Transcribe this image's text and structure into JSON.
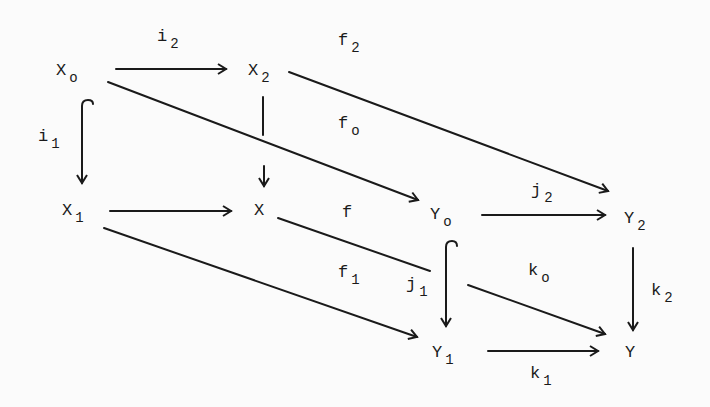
{
  "diagram": {
    "type": "commutative-cube",
    "nodes": [
      {
        "id": "X0",
        "base": "X",
        "sub": "o",
        "x": 56,
        "y": 62
      },
      {
        "id": "X2",
        "base": "X",
        "sub": "2",
        "x": 256,
        "y": 62
      },
      {
        "id": "X1",
        "base": "X",
        "sub": "1",
        "x": 64,
        "y": 202
      },
      {
        "id": "X",
        "base": "X",
        "sub": "",
        "x": 254,
        "y": 202
      },
      {
        "id": "Y0",
        "base": "Y",
        "sub": "o",
        "x": 434,
        "y": 205
      },
      {
        "id": "Y2",
        "base": "Y",
        "sub": "2",
        "x": 626,
        "y": 208
      },
      {
        "id": "Y1",
        "base": "Y",
        "sub": "1",
        "x": 434,
        "y": 342
      },
      {
        "id": "Y",
        "base": "Y",
        "sub": "",
        "x": 626,
        "y": 342
      }
    ],
    "labels": [
      {
        "id": "i2",
        "base": "i",
        "sub": "2",
        "x": 152,
        "y": 34
      },
      {
        "id": "f2",
        "base": "f",
        "sub": "2",
        "x": 338,
        "y": 34
      },
      {
        "id": "i1",
        "base": "i",
        "sub": "1",
        "x": 38,
        "y": 128
      },
      {
        "id": "f0",
        "base": "f",
        "sub": "o",
        "x": 338,
        "y": 110
      },
      {
        "id": "j2",
        "base": "j",
        "sub": "2",
        "x": 530,
        "y": 181
      },
      {
        "id": "f",
        "base": "f",
        "sub": "",
        "x": 342,
        "y": 203
      },
      {
        "id": "f1",
        "base": "f",
        "sub": "1",
        "x": 338,
        "y": 262
      },
      {
        "id": "j1",
        "base": "j",
        "sub": "1",
        "x": 405,
        "y": 275
      },
      {
        "id": "k0",
        "base": "k",
        "sub": "o",
        "x": 527,
        "y": 260
      },
      {
        "id": "k2",
        "base": "k",
        "sub": "2",
        "x": 651,
        "y": 280
      },
      {
        "id": "k1",
        "base": "k",
        "sub": "1",
        "x": 530,
        "y": 362
      }
    ],
    "arrows": [
      {
        "from": "X0",
        "to": "X2",
        "label": "i2"
      },
      {
        "from": "X0",
        "to": "X1",
        "label": "i1",
        "style": "hook"
      },
      {
        "from": "X2",
        "to": "X",
        "style": "broken"
      },
      {
        "from": "X2",
        "to": "Y2",
        "label": "f2"
      },
      {
        "from": "X0",
        "to": "Y0",
        "label": "f0"
      },
      {
        "from": "X1",
        "to": "X"
      },
      {
        "from": "X",
        "to": "Y",
        "label": "f"
      },
      {
        "from": "X1",
        "to": "Y1",
        "label": "f1"
      },
      {
        "from": "Y0",
        "to": "Y2",
        "label": "j2"
      },
      {
        "from": "Y0",
        "to": "Y1",
        "label": "j1",
        "style": "hook"
      },
      {
        "from": "Y0",
        "to": "Y",
        "label": "k0"
      },
      {
        "from": "Y2",
        "to": "Y",
        "label": "k2"
      },
      {
        "from": "Y1",
        "to": "Y",
        "label": "k1"
      }
    ]
  },
  "text": {
    "X0": {
      "b": "X",
      "s": "o"
    },
    "X2": {
      "b": "X",
      "s": "2"
    },
    "X1": {
      "b": "X",
      "s": "1"
    },
    "X": {
      "b": "X"
    },
    "Y0": {
      "b": "Y",
      "s": "o"
    },
    "Y2": {
      "b": "Y",
      "s": "2"
    },
    "Y1": {
      "b": "Y",
      "s": "1"
    },
    "Y": {
      "b": "Y"
    },
    "i2": {
      "b": "i",
      "s": "2"
    },
    "f2": {
      "b": "f",
      "s": "2"
    },
    "i1": {
      "b": "i",
      "s": "1"
    },
    "f0": {
      "b": "f",
      "s": "o"
    },
    "j2": {
      "b": "j",
      "s": "2"
    },
    "f": {
      "b": "f"
    },
    "f1": {
      "b": "f",
      "s": "1"
    },
    "j1": {
      "b": "j",
      "s": "1"
    },
    "k0": {
      "b": "k",
      "s": "o"
    },
    "k2": {
      "b": "k",
      "s": "2"
    },
    "k1": {
      "b": "k",
      "s": "1"
    }
  }
}
